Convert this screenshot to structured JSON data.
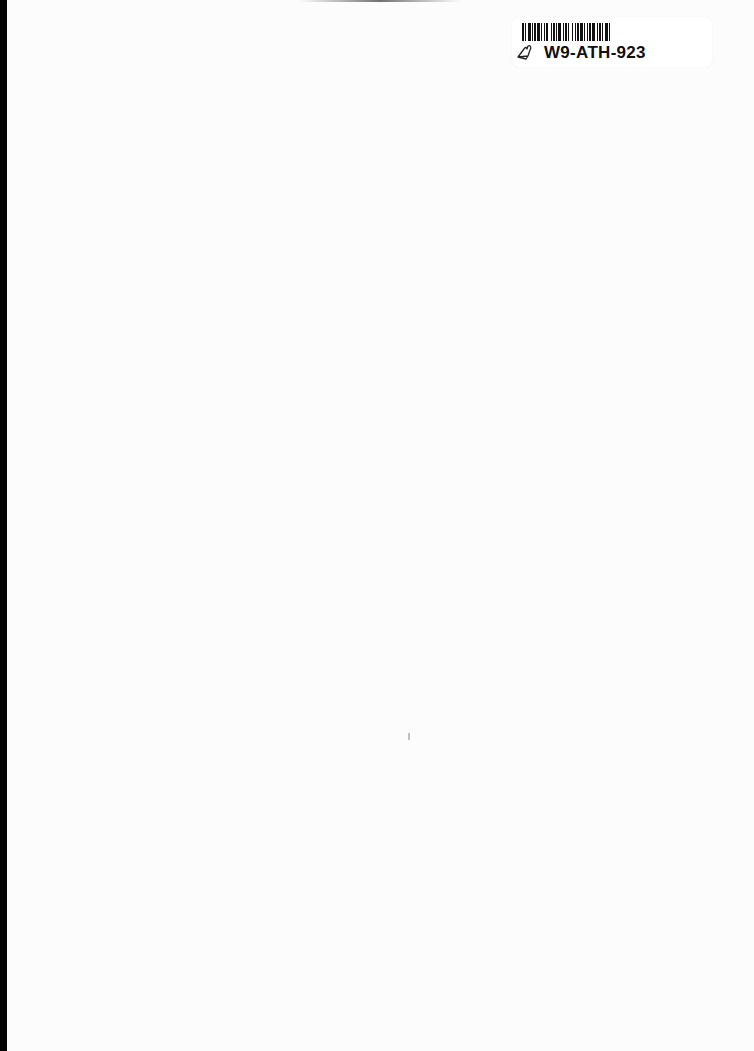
{
  "document": {
    "type": "blank scanned page",
    "background_color": "#fcfcfc",
    "left_edge_color": "#050505"
  },
  "sticker": {
    "barcode_label": "W9-ATH-923",
    "icon": "hand-drawn-heart-icon"
  }
}
